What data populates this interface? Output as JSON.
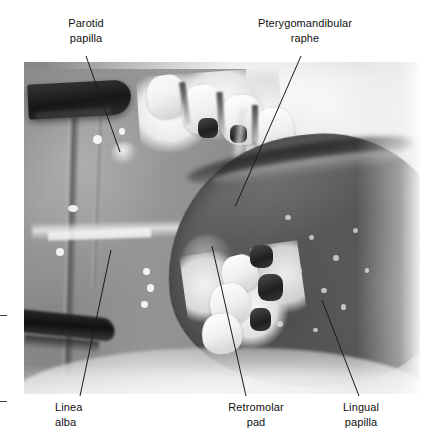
{
  "figure": {
    "kind": "intraoral-photograph",
    "background_color": "#ffffff",
    "text_color": "#111111",
    "leader_color": "#1a1a1a"
  },
  "labels": {
    "parotid_papilla": "Parotid\npapilla",
    "pterygomandibular_raphe": "Pterygomandibular\nraphe",
    "linea_alba": "Linea\nalba",
    "retromolar_pad": "Retromolar\npad",
    "lingual_papilla": "Lingual\npapilla"
  },
  "annotations": [
    {
      "id": "parotid-papilla",
      "text": "Parotid\npapilla",
      "position": "top-left",
      "align": "center",
      "leader": {
        "x1": 86,
        "y1": 56,
        "x2": 120,
        "y2": 152
      }
    },
    {
      "id": "pterygomandibular-raphe",
      "text": "Pterygomandibular\nraphe",
      "position": "top-right",
      "align": "center",
      "leader": {
        "x1": 301,
        "y1": 56,
        "x2": 235,
        "y2": 207
      }
    },
    {
      "id": "linea-alba",
      "text": "Linea\nalba",
      "position": "bottom-left",
      "align": "left",
      "leader": {
        "x1": 111,
        "y1": 250,
        "x2": 80,
        "y2": 396
      }
    },
    {
      "id": "retromolar-pad",
      "text": "Retromolar\npad",
      "position": "bottom-center",
      "align": "center",
      "leader": {
        "x1": 212,
        "y1": 246,
        "x2": 246,
        "y2": 396
      }
    },
    {
      "id": "lingual-papilla",
      "text": "Lingual\npapilla",
      "position": "bottom-right",
      "align": "center",
      "leader": {
        "x1": 322,
        "y1": 300,
        "x2": 359,
        "y2": 396
      }
    }
  ],
  "registration_marks": [
    {
      "id": "tick-upper",
      "x": 0,
      "y": 315
    },
    {
      "id": "tick-lower",
      "x": 0,
      "y": 401
    }
  ]
}
